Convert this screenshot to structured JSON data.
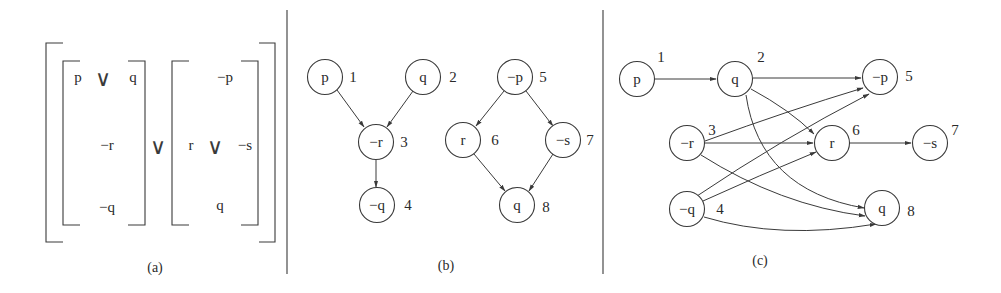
{
  "figure": {
    "panels": [
      {
        "id": "a",
        "caption": "(a)",
        "left_block": {
          "row1": {
            "left": "p",
            "op": "∨",
            "right": "q"
          },
          "row2": "−r",
          "row3": "−q"
        },
        "join_op": "∨",
        "right_block": {
          "row1": "−p",
          "row2": {
            "left": "r",
            "op": "∨",
            "right": "−s"
          },
          "row3": "q"
        }
      },
      {
        "id": "b",
        "caption": "(b)",
        "nodes": [
          {
            "id": 1,
            "label": "p",
            "number": "1"
          },
          {
            "id": 2,
            "label": "q",
            "number": "2"
          },
          {
            "id": 3,
            "label": "−r",
            "number": "3"
          },
          {
            "id": 4,
            "label": "−q",
            "number": "4"
          },
          {
            "id": 5,
            "label": "−p",
            "number": "5"
          },
          {
            "id": 6,
            "label": "r",
            "number": "6"
          },
          {
            "id": 7,
            "label": "−s",
            "number": "7"
          },
          {
            "id": 8,
            "label": "q",
            "number": "8"
          }
        ],
        "edges": [
          [
            1,
            3
          ],
          [
            2,
            3
          ],
          [
            3,
            4
          ],
          [
            5,
            6
          ],
          [
            5,
            7
          ],
          [
            6,
            8
          ],
          [
            7,
            8
          ]
        ]
      },
      {
        "id": "c",
        "caption": "(c)",
        "nodes": [
          {
            "id": 1,
            "label": "p",
            "number": "1"
          },
          {
            "id": 2,
            "label": "q",
            "number": "2"
          },
          {
            "id": 3,
            "label": "−r",
            "number": "3"
          },
          {
            "id": 4,
            "label": "−q",
            "number": "4"
          },
          {
            "id": 5,
            "label": "−p",
            "number": "5"
          },
          {
            "id": 6,
            "label": "r",
            "number": "6"
          },
          {
            "id": 7,
            "label": "−s",
            "number": "7"
          },
          {
            "id": 8,
            "label": "q",
            "number": "8"
          }
        ],
        "edges": [
          [
            1,
            2
          ],
          [
            2,
            5
          ],
          [
            2,
            6
          ],
          [
            2,
            8
          ],
          [
            3,
            5
          ],
          [
            3,
            6
          ],
          [
            3,
            8
          ],
          [
            4,
            5
          ],
          [
            4,
            6
          ],
          [
            4,
            8
          ],
          [
            6,
            7
          ]
        ]
      }
    ]
  }
}
